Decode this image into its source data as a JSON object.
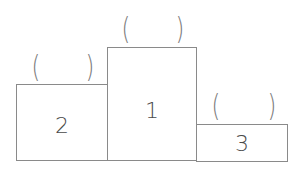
{
  "diagram": {
    "type": "podium",
    "steps": [
      {
        "rank_label": "2",
        "position": "left",
        "answer_slot": {
          "open": "(",
          "close": ")",
          "value": ""
        }
      },
      {
        "rank_label": "1",
        "position": "center",
        "answer_slot": {
          "open": "(",
          "close": ")",
          "value": ""
        }
      },
      {
        "rank_label": "3",
        "position": "right",
        "answer_slot": {
          "open": "(",
          "close": ")",
          "value": ""
        }
      }
    ],
    "colors": {
      "border": "#8a8a8a",
      "text": "#4a4a4a",
      "paren": "#7a7a7a",
      "background": "#ffffff"
    }
  }
}
